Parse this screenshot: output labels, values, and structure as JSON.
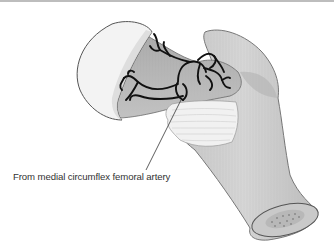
{
  "figure": {
    "label": "From medial circumflex femoral artery",
    "colors": {
      "border": "#bdbdbd",
      "head": "#f4f4f4",
      "neck": "#b8b8b8",
      "shaft": "#d0d0d0",
      "artery": "#111111",
      "capsule": "#f0f0f0",
      "outline": "#555555",
      "label_text": "#333333"
    }
  }
}
